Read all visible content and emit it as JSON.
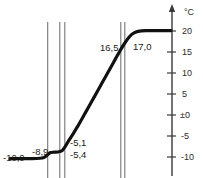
{
  "chart_data": {
    "type": "line",
    "title": "",
    "subtitle": "",
    "xlabel": "",
    "ylabel": "°C",
    "unit": "°C",
    "grid": false,
    "legend": null,
    "axis": {
      "y_ticks": [
        "20",
        "15",
        "10",
        "5",
        "±0",
        "-5",
        "-10"
      ],
      "y_tick_values": [
        20,
        15,
        10,
        5,
        0,
        -5,
        -10
      ],
      "ylim": [
        -11,
        22
      ],
      "y_axis_arrow": true,
      "x_axis_visible": false
    },
    "annotations": [
      {
        "id": "a1",
        "text": "-10,0",
        "value": -10.0
      },
      {
        "id": "a2",
        "text": "-8,9",
        "value": -8.9
      },
      {
        "id": "a3",
        "text": "-5,1",
        "value": -5.1
      },
      {
        "id": "a4",
        "text": "-5,4",
        "value": -5.4
      },
      {
        "id": "a5",
        "text": "16,5",
        "value": 16.5
      },
      {
        "id": "a6",
        "text": "17,0",
        "value": 17.0
      }
    ],
    "markers": {
      "vertical_lines": [
        47.7,
        59.7,
        64.7,
        120.7,
        124.7
      ]
    },
    "series": [
      {
        "name": "temperature-curve",
        "color": "#111111",
        "points": [
          [
            10,
            -10.4
          ],
          [
            20,
            -10.4
          ],
          [
            32,
            -10.4
          ],
          [
            40,
            -10.3
          ],
          [
            44,
            -10.1
          ],
          [
            47,
            -9.6
          ],
          [
            50,
            -9.0
          ],
          [
            54,
            -8.85
          ],
          [
            58,
            -8.8
          ],
          [
            62,
            -8.5
          ],
          [
            65,
            -7.6
          ],
          [
            68,
            -6.4
          ],
          [
            72,
            -4.9
          ],
          [
            78,
            -2.6
          ],
          [
            86,
            0.8
          ],
          [
            94,
            4.2
          ],
          [
            102,
            7.6
          ],
          [
            110,
            11.0
          ],
          [
            116,
            13.6
          ],
          [
            121,
            15.7
          ],
          [
            125,
            17.2
          ],
          [
            129,
            18.5
          ],
          [
            133,
            19.4
          ],
          [
            138,
            19.9
          ],
          [
            146,
            20.1
          ],
          [
            156,
            20.1
          ],
          [
            166,
            20.1
          ],
          [
            171,
            20.1
          ]
        ]
      }
    ]
  },
  "labels": {
    "unit": "°C",
    "tick_20": "20",
    "tick_15": "15",
    "tick_10": "10",
    "tick_5": "5",
    "tick_0": "±0",
    "tick_m5": "-5",
    "tick_m10": "-10",
    "p_m10_0": "-10,0",
    "p_m8_9": "-8,9",
    "p_m5_1": "-5,1",
    "p_m5_4": "-5,4",
    "p_16_5": "16,5",
    "p_17_0": "17,0"
  },
  "colors": {
    "curve": "#111111",
    "axis": "#3a3a3a",
    "marker_line": "#6e6e6e",
    "text": "#2b2b2b",
    "background": "#ffffff"
  }
}
